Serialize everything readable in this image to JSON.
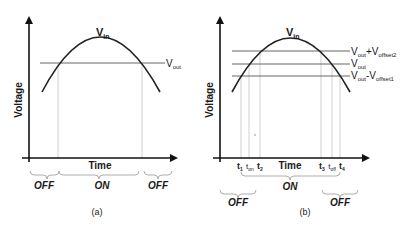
{
  "panels": [
    {
      "id": "a",
      "caption": "(a)",
      "y_axis_label": "Voltage",
      "x_axis_label": "Time",
      "curve_label": "V",
      "curve_label_sub": "in",
      "lines": [
        {
          "label": "V",
          "sub": "out",
          "extra": "",
          "extra_sub": ""
        }
      ],
      "regions": [
        "OFF",
        "ON",
        "OFF"
      ]
    },
    {
      "id": "b",
      "caption": "(b)",
      "y_axis_label": "Voltage",
      "x_axis_label": "Time",
      "curve_label": "V",
      "curve_label_sub": "in",
      "lines": [
        {
          "label": "V",
          "sub": "out",
          "op": "+V",
          "op_sub": "offset2"
        },
        {
          "label": "V",
          "sub": "out",
          "op": "",
          "op_sub": ""
        },
        {
          "label": "V",
          "sub": "out",
          "op": "-V",
          "op_sub": "offset1"
        }
      ],
      "time_marks": [
        {
          "label": "t",
          "sub": "1"
        },
        {
          "label": "t",
          "sub": "on"
        },
        {
          "label": "t",
          "sub": "2"
        },
        {
          "label": "t",
          "sub": "3"
        },
        {
          "label": "t",
          "sub": "off"
        },
        {
          "label": "t",
          "sub": "4"
        }
      ],
      "regions": [
        "OFF",
        "ON",
        "OFF"
      ]
    }
  ],
  "colors": {
    "axis": "#111111",
    "curve": "#222222",
    "level_line": "#555555",
    "guide_line": "#bbbbbb",
    "brace": "#999999",
    "text": "#1a1a1a"
  }
}
